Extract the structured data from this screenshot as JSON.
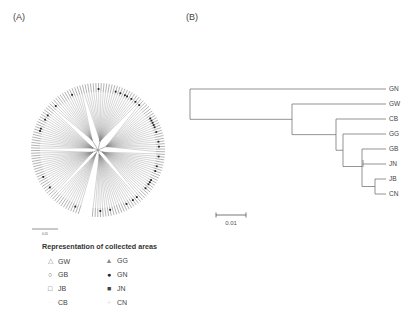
{
  "panels": {
    "a_label": "(A)",
    "b_label": "(B)"
  },
  "tree_a": {
    "type": "circular-phylogeny",
    "leaf_count": 150,
    "scale_label": "0.05"
  },
  "tree_b": {
    "type": "rectangular-phylogeny",
    "leaves": [
      "GN",
      "GW",
      "CB",
      "GG",
      "GB",
      "JN",
      "JB",
      "CN"
    ],
    "topology": "(GN,(GW,(CB,(GG,(GB,JN,(JB,CN))))))",
    "scale_label": "0.01",
    "scale_value": 0.01
  },
  "legend": {
    "title": "Representation of collected areas",
    "items": [
      {
        "symbol": "open-triangle",
        "glyph": "△",
        "label": "GW",
        "color": "#888888"
      },
      {
        "symbol": "open-circle",
        "glyph": "○",
        "label": "GB",
        "color": "#555555"
      },
      {
        "symbol": "open-square",
        "glyph": "□",
        "label": "JB",
        "color": "#555555"
      },
      {
        "symbol": "faint-mark",
        "glyph": "·",
        "label": "CB",
        "color": "#dddddd"
      },
      {
        "symbol": "filled-triangle",
        "glyph": "▲",
        "label": "GG",
        "color": "#888888"
      },
      {
        "symbol": "filled-circle",
        "glyph": "●",
        "label": "GN",
        "color": "#222222"
      },
      {
        "symbol": "filled-square",
        "glyph": "■",
        "label": "JN",
        "color": "#444444"
      },
      {
        "symbol": "faint-cross",
        "glyph": "+",
        "label": "CN",
        "color": "#dddddd"
      }
    ]
  }
}
